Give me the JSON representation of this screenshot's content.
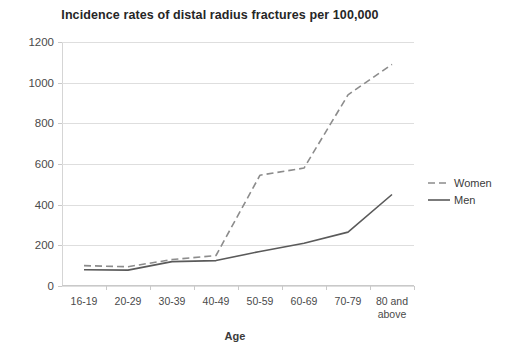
{
  "chart_data": {
    "type": "line",
    "title": "Incidence rates of distal radius fractures per 100,000",
    "xlabel": "Age",
    "ylabel": "",
    "categories": [
      "16-19",
      "20-29",
      "30-39",
      "40-49",
      "50-59",
      "60-69",
      "70-79",
      "80 and\nabove"
    ],
    "series": [
      {
        "name": "Women",
        "style": "dashed",
        "color": "#8c8c8c",
        "values": [
          100,
          95,
          130,
          150,
          545,
          580,
          940,
          1090
        ]
      },
      {
        "name": "Men",
        "style": "solid",
        "color": "#5a5a5a",
        "values": [
          80,
          78,
          120,
          125,
          170,
          210,
          265,
          450
        ]
      }
    ],
    "ylim": [
      0,
      1200
    ],
    "yticks": [
      0,
      200,
      400,
      600,
      800,
      1000,
      1200
    ],
    "ytick_labels": [
      "0",
      "200",
      "400",
      "600",
      "800",
      "1000",
      "1200"
    ],
    "grid": true,
    "legend_position": "right"
  },
  "legend": {
    "entries": [
      {
        "label": "Women"
      },
      {
        "label": "Men"
      }
    ]
  }
}
